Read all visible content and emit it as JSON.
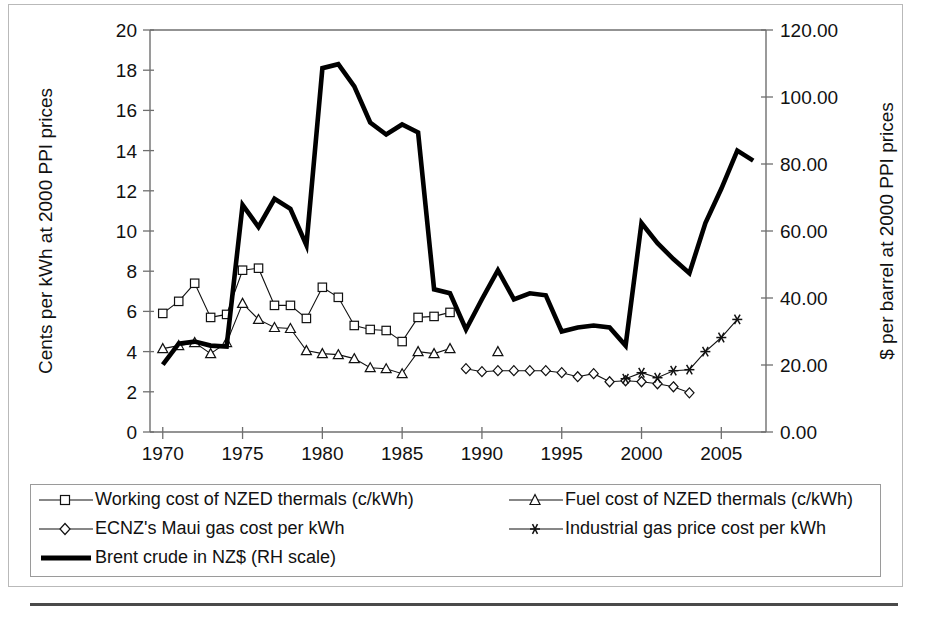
{
  "chart_data": {
    "type": "line",
    "title": "",
    "xlabel": "",
    "ylabel": "Cents per kWh at 2000 PPI prices",
    "y2label": "$ per barrel at 2000 PPI prices",
    "xlim": [
      1969.2,
      2007.8
    ],
    "ylim": [
      0,
      20
    ],
    "y2lim": [
      0,
      120
    ],
    "grid": false,
    "legend_position": "below-plot",
    "x_ticks": [
      "1970",
      "1975",
      "1980",
      "1985",
      "1990",
      "1995",
      "2000",
      "2005"
    ],
    "x_tick_values": [
      1970,
      1975,
      1980,
      1985,
      1990,
      1995,
      2000,
      2005
    ],
    "y_ticks": [
      "0",
      "2",
      "4",
      "6",
      "8",
      "10",
      "12",
      "14",
      "16",
      "18",
      "20"
    ],
    "y_tick_values": [
      0,
      2,
      4,
      6,
      8,
      10,
      12,
      14,
      16,
      18,
      20
    ],
    "y2_ticks": [
      "0.00",
      "20.00",
      "40.00",
      "60.00",
      "80.00",
      "100.00",
      "120.00"
    ],
    "y2_tick_values": [
      0,
      20,
      40,
      60,
      80,
      100,
      120
    ],
    "series": [
      {
        "name": "Working cost of NZED thermals (c/kWh)",
        "marker": "square",
        "axis": "left",
        "x": [
          1970,
          1971,
          1972,
          1973,
          1974,
          1975,
          1976,
          1977,
          1978,
          1979,
          1980,
          1981,
          1982,
          1983,
          1984,
          1985,
          1986,
          1987,
          1988
        ],
        "values": [
          5.9,
          6.5,
          7.4,
          5.7,
          5.85,
          8.05,
          8.15,
          6.3,
          6.3,
          5.65,
          7.2,
          6.7,
          5.3,
          5.1,
          5.05,
          4.5,
          5.7,
          5.75,
          5.95
        ]
      },
      {
        "name": "Fuel cost of NZED thermals (c/kWh)",
        "marker": "triangle",
        "axis": "left",
        "x": [
          1970,
          1971,
          1972,
          1973,
          1974,
          1975,
          1976,
          1977,
          1978,
          1979,
          1980,
          1981,
          1982,
          1983,
          1984,
          1985,
          1986,
          1987,
          1988,
          1991
        ],
        "values": [
          4.15,
          4.3,
          4.45,
          3.9,
          4.45,
          6.4,
          5.6,
          5.2,
          5.15,
          4.05,
          3.9,
          3.85,
          3.65,
          3.2,
          3.15,
          2.9,
          4.0,
          3.9,
          4.15,
          4.0
        ]
      },
      {
        "name": "ECNZ's Maui gas cost per kWh",
        "marker": "diamond",
        "axis": "left",
        "x": [
          1989,
          1990,
          1991,
          1992,
          1993,
          1994,
          1995,
          1996,
          1997,
          1998,
          1999,
          2000,
          2001,
          2002,
          2003
        ],
        "values": [
          3.15,
          3.0,
          3.05,
          3.05,
          3.05,
          3.05,
          2.95,
          2.75,
          2.9,
          2.5,
          2.55,
          2.5,
          2.4,
          2.25,
          1.95
        ]
      },
      {
        "name": "Industrial gas price cost per kWh",
        "marker": "asterisk",
        "axis": "left",
        "x": [
          1999,
          2000,
          2001,
          2002,
          2003,
          2004,
          2005,
          2006
        ],
        "values": [
          2.65,
          2.95,
          2.7,
          3.05,
          3.1,
          4.0,
          4.7,
          5.6
        ]
      },
      {
        "name": "Brent crude in NZ$ (RH scale)",
        "marker": "none",
        "axis": "right",
        "x": [
          1970,
          1971,
          1972,
          1973,
          1974,
          1975,
          1976,
          1977,
          1978,
          1979,
          1980,
          1981,
          1982,
          1983,
          1984,
          1985,
          1986,
          1987,
          1988,
          1989,
          1990,
          1991,
          1992,
          1993,
          1994,
          1995,
          1996,
          1997,
          1998,
          1999,
          2000,
          2001,
          2002,
          2003,
          2004,
          2005,
          2006,
          2007
        ],
        "values_left_scale": [
          3.35,
          4.4,
          4.5,
          4.3,
          4.25,
          11.3,
          10.2,
          11.6,
          11.1,
          9.3,
          18.1,
          18.3,
          17.2,
          15.4,
          14.8,
          15.3,
          14.9,
          7.1,
          6.9,
          5.1,
          6.6,
          8.05,
          6.6,
          6.9,
          6.8,
          5.0,
          5.2,
          5.3,
          5.2,
          4.3,
          10.4,
          9.4,
          8.6,
          7.9,
          10.4,
          12.1,
          14.0,
          13.5
        ],
        "values": [
          20.1,
          26.4,
          27.0,
          25.8,
          25.5,
          67.8,
          61.2,
          69.6,
          66.6,
          55.8,
          108.6,
          109.8,
          103.2,
          92.4,
          88.8,
          91.8,
          89.4,
          42.6,
          41.4,
          30.6,
          39.6,
          48.3,
          39.6,
          41.4,
          40.8,
          30.0,
          31.2,
          31.8,
          31.2,
          25.8,
          62.4,
          56.4,
          51.6,
          47.4,
          62.4,
          72.6,
          84.0,
          81.0
        ]
      }
    ]
  },
  "legend": {
    "entries": [
      {
        "label": "Working cost of NZED thermals (c/kWh)",
        "marker": "square"
      },
      {
        "label": "Fuel cost of NZED thermals (c/kWh)",
        "marker": "triangle"
      },
      {
        "label": "ECNZ's Maui gas cost per kWh",
        "marker": "diamond"
      },
      {
        "label": "Industrial gas price cost per kWh",
        "marker": "asterisk"
      },
      {
        "label": "Brent crude in NZ$ (RH scale)",
        "marker": "thickline"
      }
    ]
  }
}
